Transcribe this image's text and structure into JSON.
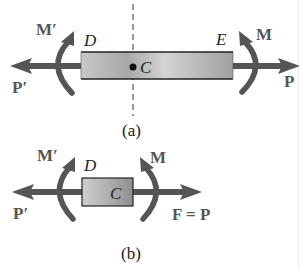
{
  "colors": {
    "arrow": "#555555",
    "beam_edge": "#222222",
    "beam_fill_light": "#d8d8d8",
    "beam_fill_dark": "#9a9a9a",
    "label": "#222222"
  },
  "figure_a": {
    "caption": "(a)",
    "labels": {
      "moment_left": "M′",
      "force_left": "P′",
      "end_left": "D",
      "end_right": "E",
      "centroid": "C",
      "moment_right": "M",
      "force_right": "P"
    }
  },
  "figure_b": {
    "caption": "(b)",
    "labels": {
      "moment_left": "M′",
      "force_left": "P′",
      "end_left": "D",
      "centroid": "C",
      "moment_right": "M",
      "force_right": "F = P"
    }
  }
}
